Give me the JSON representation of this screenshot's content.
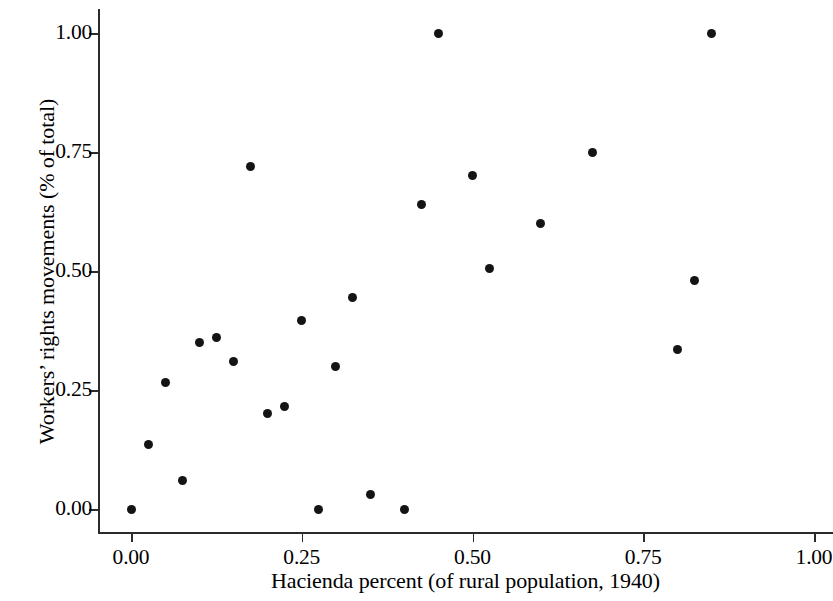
{
  "chart_data": {
    "type": "scatter",
    "title": "",
    "xlabel": "Hacienda percent (of rural population, 1940)",
    "ylabel": "Workers’ rights movements (% of total)",
    "xlim": [
      0.0,
      1.0
    ],
    "ylim": [
      0.0,
      1.0
    ],
    "grid": false,
    "legend": null,
    "xticks": [
      0.0,
      0.25,
      0.5,
      0.75,
      1.0
    ],
    "yticks": [
      0.0,
      0.25,
      0.5,
      0.75,
      1.0
    ],
    "xticklabels": [
      "0.00",
      "0.25",
      "0.50",
      "0.75",
      "1.00"
    ],
    "yticklabels": [
      "0.00",
      "0.25",
      "0.50",
      "0.75",
      "1.00"
    ],
    "marker": {
      "shape": "circle",
      "color": "#141414",
      "size": 9
    },
    "points": [
      {
        "x": 0.0,
        "y": 0.0
      },
      {
        "x": 0.025,
        "y": 0.135
      },
      {
        "x": 0.05,
        "y": 0.265
      },
      {
        "x": 0.075,
        "y": 0.06
      },
      {
        "x": 0.1,
        "y": 0.35
      },
      {
        "x": 0.125,
        "y": 0.36
      },
      {
        "x": 0.15,
        "y": 0.31
      },
      {
        "x": 0.175,
        "y": 0.72
      },
      {
        "x": 0.2,
        "y": 0.2
      },
      {
        "x": 0.225,
        "y": 0.215
      },
      {
        "x": 0.25,
        "y": 0.395
      },
      {
        "x": 0.275,
        "y": 0.0
      },
      {
        "x": 0.3,
        "y": 0.3
      },
      {
        "x": 0.325,
        "y": 0.445
      },
      {
        "x": 0.35,
        "y": 0.03
      },
      {
        "x": 0.4,
        "y": 0.0
      },
      {
        "x": 0.425,
        "y": 0.64
      },
      {
        "x": 0.45,
        "y": 1.0
      },
      {
        "x": 0.5,
        "y": 0.7
      },
      {
        "x": 0.525,
        "y": 0.505
      },
      {
        "x": 0.6,
        "y": 0.6
      },
      {
        "x": 0.675,
        "y": 0.75
      },
      {
        "x": 0.8,
        "y": 0.335
      },
      {
        "x": 0.825,
        "y": 0.48
      },
      {
        "x": 0.85,
        "y": 1.0
      }
    ]
  },
  "axes": {
    "x_title": "Hacienda percent (of rural population, 1940)",
    "y_title": "Workers’ rights movements (% of total)"
  }
}
